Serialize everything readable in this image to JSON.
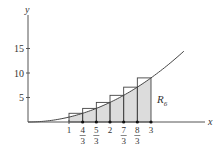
{
  "figure": {
    "function": "y = x^2",
    "x_axis_label": "x",
    "y_axis_label": "y",
    "region_label": "R",
    "region_subscript": "6",
    "y_ticks": [
      {
        "value": 5,
        "label": "5"
      },
      {
        "value": 10,
        "label": "10"
      },
      {
        "value": 15,
        "label": "15"
      }
    ],
    "x_ticks": [
      {
        "value": 1,
        "num": "1",
        "den": ""
      },
      {
        "value": 1.3333,
        "num": "4",
        "den": "3"
      },
      {
        "value": 1.6667,
        "num": "5",
        "den": "3"
      },
      {
        "value": 2,
        "num": "2",
        "den": ""
      },
      {
        "value": 2.3333,
        "num": "7",
        "den": "3"
      },
      {
        "value": 2.6667,
        "num": "8",
        "den": "3"
      },
      {
        "value": 3,
        "num": "3",
        "den": ""
      }
    ],
    "rectangles": [
      {
        "x0": 1,
        "x1": 1.3333,
        "height": 1.778
      },
      {
        "x0": 1.3333,
        "x1": 1.6667,
        "height": 2.778
      },
      {
        "x0": 1.6667,
        "x1": 2,
        "height": 4.0
      },
      {
        "x0": 2,
        "x1": 2.3333,
        "height": 5.444
      },
      {
        "x0": 2.3333,
        "x1": 2.6667,
        "height": 7.111
      },
      {
        "x0": 2.6667,
        "x1": 3,
        "height": 9.0
      }
    ],
    "colors": {
      "axis": "#555555",
      "curve": "#444444",
      "shade": "#dcdcdc",
      "rect_stroke": "#444444"
    }
  }
}
